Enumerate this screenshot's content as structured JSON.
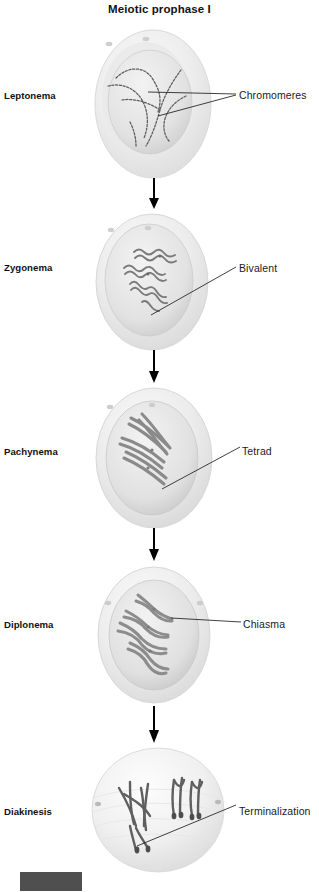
{
  "figure": {
    "title": "Meiotic prophase I",
    "type": "biology-diagram",
    "flow_direction": "top-to-bottom",
    "stage_count": 5
  },
  "stages": [
    {
      "name": "Leptonema",
      "callout": "Chromomeres",
      "chromosome_description": "long thin single threads with beaded chromomeres",
      "label_top": 90,
      "callout_top": 89,
      "callout_left": 239,
      "cell_top": 26,
      "cell_height": 155
    },
    {
      "name": "Zygonema",
      "callout": "Bivalent",
      "chromosome_description": "homologous chromosomes pairing into bivalents via synapsis",
      "label_top": 262,
      "callout_top": 262,
      "callout_left": 239,
      "cell_top": 210,
      "cell_height": 140
    },
    {
      "name": "Pachynema",
      "callout": "Tetrad",
      "chromosome_description": "thickened, fully synapsed bivalents visible as four-stranded tetrads",
      "label_top": 446,
      "callout_top": 445,
      "callout_left": 242,
      "cell_top": 384,
      "cell_height": 148
    },
    {
      "name": "Diplonema",
      "callout": "Chiasma",
      "chromosome_description": "homologues separating but joined at chiasmata",
      "label_top": 619,
      "callout_top": 618,
      "callout_left": 243,
      "cell_top": 561,
      "cell_height": 145
    },
    {
      "name": "Diakinesis",
      "callout": "Terminalization",
      "chromosome_description": "condensed bivalents with chiasmata terminalizing toward chromosome ends",
      "label_top": 806,
      "callout_top": 805,
      "callout_left": 239,
      "cell_top": 744,
      "cell_height": 130
    }
  ],
  "arrows": [
    {
      "top": 178,
      "height": 30
    },
    {
      "top": 348,
      "height": 32
    },
    {
      "top": 528,
      "height": 32
    },
    {
      "top": 706,
      "height": 36
    }
  ],
  "colors": {
    "background": "#ffffff",
    "text": "#111111",
    "cell_outer": "#ededed",
    "cell_inner": "#e3e3e3",
    "nucleus": "#dcdcdc",
    "chromosome": "#6e6e6e",
    "chromosome_dark": "#4a4a4a",
    "leader_line": "#1f1f1f",
    "arrow": "#000000",
    "caption_swatch": "#4f4f4f"
  },
  "caption": {
    "swatch_present": true,
    "text": ""
  }
}
